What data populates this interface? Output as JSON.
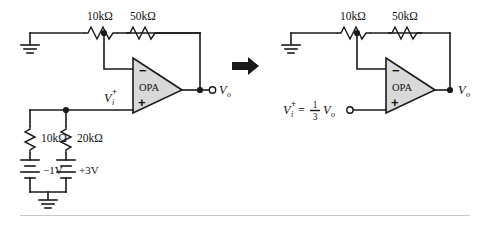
{
  "figure": {
    "transition_arrow": "right-arrow"
  },
  "left_circuit": {
    "name": "original-circuit",
    "r_input": "10kΩ",
    "r_feedback": "50kΩ",
    "r_div_top": "10kΩ",
    "r_div_bottom": "20kΩ",
    "battery_left": "−1V",
    "battery_right": "+3V",
    "opamp_label": "OPA",
    "inverting_sign": "−",
    "noninverting_sign": "+",
    "v_plus_symbol": "V",
    "v_plus_sub": "i",
    "v_plus_sup": "+",
    "v_out_symbol": "V",
    "v_out_sub": "o",
    "ground_top": "ground",
    "ground_bottom": "ground"
  },
  "right_circuit": {
    "name": "equivalent-circuit",
    "r_input": "10kΩ",
    "r_feedback": "50kΩ",
    "opamp_label": "OPA",
    "inverting_sign": "−",
    "noninverting_sign": "+",
    "v_plus_symbol": "V",
    "v_plus_sub": "i",
    "v_plus_sup": "+",
    "equals": "=",
    "frac_numerator": "1",
    "frac_denominator": "3",
    "frac_of_symbol": "V",
    "frac_of_sub": "o",
    "v_out_symbol": "V",
    "v_out_sub": "o",
    "ground_top": "ground"
  }
}
